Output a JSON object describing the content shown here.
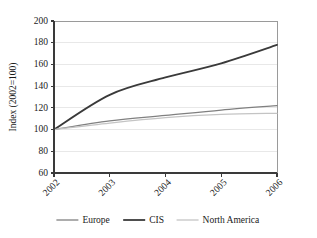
{
  "chart_data": {
    "type": "line",
    "title": "",
    "xlabel": "",
    "ylabel": "Index (2002=100)",
    "categories": [
      "2002",
      "2003",
      "2004",
      "2005",
      "2006"
    ],
    "x": [
      2002,
      2003,
      2004,
      2005,
      2006
    ],
    "ylim": [
      60,
      200
    ],
    "yticks": [
      60,
      80,
      100,
      120,
      140,
      160,
      180,
      200
    ],
    "ytick_labels": [
      "60",
      "80",
      "100",
      "120",
      "140",
      "160",
      "180",
      "200"
    ],
    "grid": true,
    "legend_position": "bottom",
    "series": [
      {
        "name": "Europe",
        "color": "#808080",
        "width": 1.3,
        "values": [
          100,
          108,
          113,
          118,
          122
        ]
      },
      {
        "name": "CIS",
        "color": "#3a3a3a",
        "width": 1.8,
        "values": [
          100,
          132,
          148,
          161,
          178
        ]
      },
      {
        "name": "North America",
        "color": "#c4c4c4",
        "width": 1.3,
        "values": [
          100,
          106,
          111,
          114,
          115
        ]
      }
    ]
  },
  "legend": {
    "items": [
      {
        "label": "Europe"
      },
      {
        "label": "CIS"
      },
      {
        "label": "North America"
      }
    ]
  },
  "axes": {
    "y_axis_title": "Index (2002=100)"
  }
}
